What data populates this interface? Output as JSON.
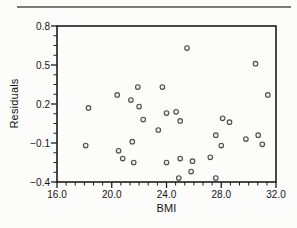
{
  "figure": {
    "background": "#fcfcfa",
    "top_rule_color": "#7a7a7a",
    "axis_color": "#1c1c1c",
    "text_color": "#141414"
  },
  "chart_data": {
    "type": "scatter",
    "title": "",
    "xlabel": "BMI",
    "ylabel": "Residuals",
    "xlim": [
      16.0,
      32.0
    ],
    "ylim": [
      -0.4,
      0.8
    ],
    "grid": false,
    "legend": false,
    "x_major_ticks": [
      16.0,
      20.0,
      24.0,
      28.0,
      32.0
    ],
    "x_tick_labels": [
      "16.0",
      "20.0",
      "24.0",
      "28.0",
      "32.0"
    ],
    "x_minor_divisions": 6,
    "y_major_ticks": [
      0.8,
      0.5,
      0.2,
      -0.1,
      -0.4
    ],
    "y_tick_labels": [
      "0.8",
      "0.5",
      "0.2",
      "−0.1",
      "−0.4"
    ],
    "y_minor_divisions": 4,
    "marker": {
      "shape": "circle",
      "fill": "#ececec",
      "stroke": "#4d4d4d",
      "radius_px": 2.3
    },
    "points": [
      [
        25.5,
        0.63
      ],
      [
        30.5,
        0.51
      ],
      [
        21.9,
        0.33
      ],
      [
        23.7,
        0.33
      ],
      [
        20.4,
        0.27
      ],
      [
        31.4,
        0.27
      ],
      [
        21.4,
        0.23
      ],
      [
        18.3,
        0.17
      ],
      [
        22.0,
        0.18
      ],
      [
        24.0,
        0.13
      ],
      [
        24.7,
        0.14
      ],
      [
        22.3,
        0.08
      ],
      [
        25.0,
        0.07
      ],
      [
        28.1,
        0.09
      ],
      [
        28.6,
        0.06
      ],
      [
        23.4,
        0.0
      ],
      [
        18.1,
        -0.12
      ],
      [
        21.5,
        -0.09
      ],
      [
        27.6,
        -0.04
      ],
      [
        29.8,
        -0.07
      ],
      [
        30.7,
        -0.04
      ],
      [
        31.0,
        -0.11
      ],
      [
        20.5,
        -0.16
      ],
      [
        20.8,
        -0.22
      ],
      [
        21.6,
        -0.25
      ],
      [
        24.0,
        -0.25
      ],
      [
        25.0,
        -0.22
      ],
      [
        25.9,
        -0.24
      ],
      [
        27.2,
        -0.21
      ],
      [
        28.0,
        -0.12
      ],
      [
        25.8,
        -0.32
      ],
      [
        24.9,
        -0.37
      ],
      [
        27.6,
        -0.37
      ]
    ]
  }
}
